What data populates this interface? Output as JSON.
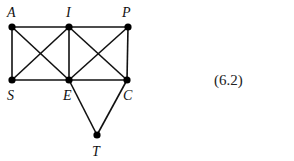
{
  "figure": {
    "equation_number": "(6.2)",
    "nodes": [
      {
        "id": "A",
        "label": "A",
        "x": 12,
        "y": 27,
        "lx": 7,
        "ly": 17
      },
      {
        "id": "I",
        "label": "I",
        "x": 69,
        "y": 27,
        "lx": 66,
        "ly": 17
      },
      {
        "id": "P",
        "label": "P",
        "x": 128,
        "y": 27,
        "lx": 122,
        "ly": 17
      },
      {
        "id": "S",
        "label": "S",
        "x": 12,
        "y": 80,
        "lx": 7,
        "ly": 100
      },
      {
        "id": "E",
        "label": "E",
        "x": 69,
        "y": 80,
        "lx": 63,
        "ly": 100
      },
      {
        "id": "C",
        "label": "C",
        "x": 127,
        "y": 80,
        "lx": 123,
        "ly": 100
      },
      {
        "id": "T",
        "label": "T",
        "x": 97,
        "y": 135,
        "lx": 92,
        "ly": 156
      }
    ],
    "edges": [
      [
        "A",
        "I"
      ],
      [
        "I",
        "P"
      ],
      [
        "S",
        "E"
      ],
      [
        "E",
        "C"
      ],
      [
        "A",
        "S"
      ],
      [
        "I",
        "E"
      ],
      [
        "P",
        "C"
      ],
      [
        "A",
        "E"
      ],
      [
        "I",
        "S"
      ],
      [
        "I",
        "C"
      ],
      [
        "P",
        "E"
      ],
      [
        "E",
        "T"
      ],
      [
        "C",
        "T"
      ]
    ]
  }
}
